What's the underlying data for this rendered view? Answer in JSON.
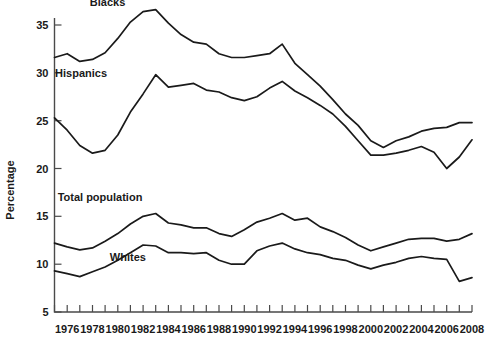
{
  "chart_data": {
    "type": "line",
    "title": "",
    "subtitle": "",
    "xlabel": "",
    "ylabel": "Percentage",
    "xlim": [
      1974.4,
      2008.6
    ],
    "ylim": [
      5,
      36.8
    ],
    "grid": false,
    "legend_position": "inline-labels",
    "y_ticks": [
      5,
      10,
      15,
      20,
      25,
      30,
      35
    ],
    "y_tick_labels": [
      "5",
      "10",
      "15",
      "20",
      "25",
      "30",
      "35"
    ],
    "x_ticks": [
      1975,
      1976,
      1977,
      1978,
      1979,
      1980,
      1981,
      1982,
      1983,
      1984,
      1985,
      1986,
      1987,
      1988,
      1989,
      1990,
      1991,
      1992,
      1993,
      1994,
      1995,
      1996,
      1997,
      1998,
      1999,
      2000,
      2001,
      2002,
      2003,
      2004,
      2005,
      2006,
      2007,
      2008
    ],
    "x_tick_labels": [
      "1976",
      "1978",
      "1980",
      "1982",
      "1984",
      "1986",
      "1988",
      "1990",
      "1992",
      "1994",
      "1996",
      "1998",
      "2000",
      "2002",
      "2004",
      "2006",
      "2008"
    ],
    "x_tick_label_years": [
      1976,
      1978,
      1980,
      1982,
      1984,
      1986,
      1988,
      1990,
      1992,
      1994,
      1996,
      1998,
      2000,
      2002,
      2004,
      2006,
      2008
    ],
    "x": [
      1975,
      1976,
      1977,
      1978,
      1979,
      1980,
      1981,
      1982,
      1983,
      1984,
      1985,
      1986,
      1987,
      1988,
      1989,
      1990,
      1991,
      1992,
      1993,
      1994,
      1995,
      1996,
      1997,
      1998,
      1999,
      2000,
      2001,
      2002,
      2003,
      2004,
      2005,
      2006,
      2007,
      2008
    ],
    "series": [
      {
        "name": "Blacks",
        "label": "Blacks",
        "color": "#1a1a1a",
        "label_x": 1979.2,
        "label_y": 37.0,
        "values": [
          31.6,
          32.0,
          31.2,
          31.4,
          32.1,
          33.6,
          35.3,
          36.4,
          36.6,
          35.2,
          34.0,
          33.2,
          33.0,
          32.0,
          31.6,
          31.6,
          31.8,
          32.0,
          33.0,
          31.0,
          29.8,
          28.6,
          27.2,
          25.7,
          24.5,
          22.9,
          22.2,
          22.9,
          23.3,
          23.9,
          24.2,
          24.3,
          24.8,
          24.8
        ]
      },
      {
        "name": "Hispanics",
        "label": "Hispanics",
        "color": "#1a1a1a",
        "label_x": 1977.1,
        "label_y": 29.6,
        "values": [
          25.3,
          24.0,
          22.4,
          21.6,
          21.9,
          23.5,
          25.9,
          27.8,
          29.8,
          28.5,
          28.7,
          28.9,
          28.2,
          28.0,
          27.4,
          27.1,
          27.5,
          28.4,
          29.1,
          28.1,
          27.4,
          26.6,
          25.7,
          24.4,
          22.9,
          21.4,
          21.4,
          21.6,
          21.9,
          22.3,
          21.7,
          20.0,
          21.2,
          23.0
        ]
      },
      {
        "name": "Total population",
        "label": "Total population",
        "color": "#1a1a1a",
        "label_x": 1978.6,
        "label_y": 16.6,
        "values": [
          12.2,
          11.8,
          11.5,
          11.7,
          12.4,
          13.2,
          14.2,
          15.0,
          15.3,
          14.3,
          14.1,
          13.8,
          13.8,
          13.2,
          12.9,
          13.6,
          14.4,
          14.8,
          15.3,
          14.6,
          14.8,
          13.9,
          13.4,
          12.8,
          12.0,
          11.4,
          11.8,
          12.2,
          12.6,
          12.7,
          12.7,
          12.4,
          12.6,
          13.2
        ]
      },
      {
        "name": "Whites",
        "label": "Whites",
        "color": "#1a1a1a",
        "label_x": 1980.8,
        "label_y": 10.3,
        "values": [
          9.3,
          9.0,
          8.7,
          9.2,
          9.7,
          10.4,
          11.2,
          12.0,
          11.9,
          11.2,
          11.2,
          11.1,
          11.2,
          10.4,
          10.0,
          10.0,
          11.4,
          11.9,
          12.2,
          11.6,
          11.2,
          11.0,
          10.6,
          10.4,
          9.9,
          9.5,
          9.9,
          10.2,
          10.6,
          10.8,
          10.6,
          10.5,
          8.2,
          8.6
        ]
      }
    ]
  },
  "figure": {
    "y_axis_title": "Percentage"
  }
}
